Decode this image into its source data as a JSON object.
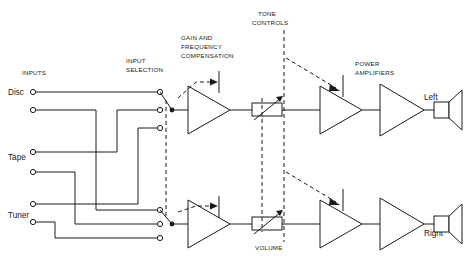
{
  "diagram": {
    "labels": {
      "inputs": "INPUTS",
      "input_selection": "INPUT\nSELECTION",
      "input_selection_l1": "INPUT",
      "input_selection_l2": "SELECTION",
      "gain_l1": "GAIN AND",
      "gain_l2": "FREQUENCY",
      "gain_l3": "COMPENSATION",
      "tone_l1": "TONE",
      "tone_l2": "CONTROLS",
      "power_l1": "POWER",
      "power_l2": "AMPLIFIERS",
      "volume": "VOLUME"
    },
    "sources": [
      {
        "name": "Disc",
        "label": "Disc",
        "terminals_y": [
          92,
          110
        ]
      },
      {
        "name": "Tape",
        "label": "Tape",
        "terminals_y": [
          152,
          172
        ]
      },
      {
        "name": "Tuner",
        "label": "Tuner",
        "terminals_y": [
          204,
          222
        ]
      }
    ],
    "channels": [
      {
        "id": "left",
        "label": "Left",
        "speaker_label": "Left"
      },
      {
        "id": "right",
        "label": "Right",
        "speaker_label": "Right"
      }
    ],
    "stages": [
      "input selection switch",
      "preamplifier with gain and frequency compensation",
      "volume control potentiometer",
      "tone control amplifier",
      "power amplifier",
      "loudspeaker"
    ],
    "colors": {
      "ink": "#1a1a1a",
      "background": "#ffffff"
    }
  }
}
